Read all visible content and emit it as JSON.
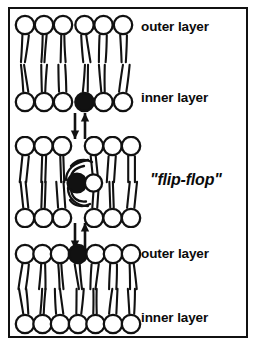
{
  "figure": {
    "background_color": "#ffffff",
    "ink_color": "#111111",
    "frame": {
      "stroke_color": "#111111",
      "stroke_width": 2
    }
  },
  "labels": {
    "outer_layer_top": "outer layer",
    "inner_layer_top": "inner layer",
    "flip_flop": "\"flip-flop\"",
    "outer_layer_bottom": "outer layer",
    "inner_layer_bottom": "inner layer"
  },
  "panels": [
    {
      "id": "top-bilayer",
      "name": "top-membrane-bilayer",
      "outer_row": {
        "layer": "outer layer",
        "head_count": 6,
        "filled_indices": [],
        "head_fill": "#ffffff"
      },
      "inner_row": {
        "layer": "inner layer",
        "head_count": 6,
        "filled_indices": [
          3
        ],
        "head_fill": "#ffffff",
        "marked_head_fill": "#111111"
      }
    },
    {
      "id": "middle-bilayer",
      "name": "middle-membrane-bilayer-transit",
      "outer_row": {
        "layer": "outer layer",
        "head_count": 6,
        "filled_indices": [],
        "gap_at_center": true,
        "head_fill": "#ffffff"
      },
      "inner_row": {
        "layer": "inner layer",
        "head_count": 6,
        "filled_indices": [],
        "gap_at_center": true,
        "head_fill": "#ffffff"
      },
      "transiting_lipid": {
        "marked_head_fill": "#111111",
        "partner_head_fill": "#ffffff",
        "description": "lipid mid-translocation with swirling tails"
      }
    },
    {
      "id": "bottom-bilayer",
      "name": "bottom-membrane-bilayer",
      "outer_row": {
        "layer": "outer layer",
        "head_count": 7,
        "filled_indices": [
          3
        ],
        "head_fill": "#ffffff",
        "marked_head_fill": "#111111"
      },
      "inner_row": {
        "layer": "inner layer",
        "head_count": 7,
        "filled_indices": [],
        "head_fill": "#ffffff"
      }
    }
  ],
  "arrows": [
    {
      "id": "arrows-top",
      "name": "transition-arrows-top",
      "directions": [
        "down",
        "up"
      ],
      "count": 2
    },
    {
      "id": "arrows-bottom",
      "name": "transition-arrows-bottom",
      "directions": [
        "down",
        "up"
      ],
      "count": 2
    }
  ]
}
